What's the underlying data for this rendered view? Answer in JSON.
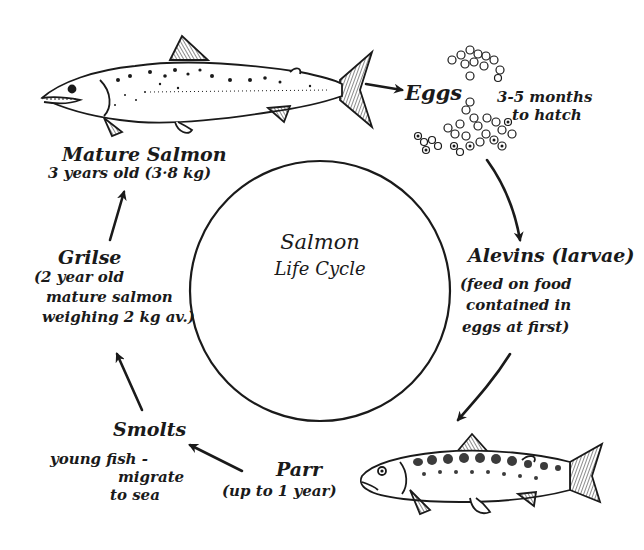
{
  "diagram": {
    "title_line1": "Salmon",
    "title_line2": "Life Cycle",
    "stages": [
      {
        "id": "mature",
        "title": "Mature Salmon",
        "detail": [
          "3 years old (3·8 kg)"
        ],
        "icon": "adult-salmon-illustration"
      },
      {
        "id": "eggs",
        "title": "Eggs",
        "detail": [
          "3-5 months",
          "to hatch"
        ],
        "icon": "egg-cluster-illustration"
      },
      {
        "id": "alevins",
        "title": "Alevins (larvae)",
        "detail": [
          "(feed on food",
          "contained in",
          "eggs at first)"
        ]
      },
      {
        "id": "parr",
        "title": "Parr",
        "detail": [
          "(up to 1 year)"
        ],
        "icon": "parr-fish-illustration"
      },
      {
        "id": "smolts",
        "title": "Smolts",
        "detail": [
          "young fish -",
          "migrate",
          "to sea"
        ]
      },
      {
        "id": "grilse",
        "title": "Grilse",
        "detail": [
          "(2 year old",
          "mature salmon",
          "weighing 2 kg av.)"
        ]
      }
    ],
    "arrows": [
      {
        "from": "mature",
        "to": "eggs"
      },
      {
        "from": "eggs",
        "to": "alevins"
      },
      {
        "from": "alevins",
        "to": "parr"
      },
      {
        "from": "parr",
        "to": "smolts"
      },
      {
        "from": "smolts",
        "to": "grilse"
      },
      {
        "from": "grilse",
        "to": "mature"
      }
    ],
    "colors": {
      "ink": "#1a1a1a",
      "background": "#ffffff"
    }
  }
}
